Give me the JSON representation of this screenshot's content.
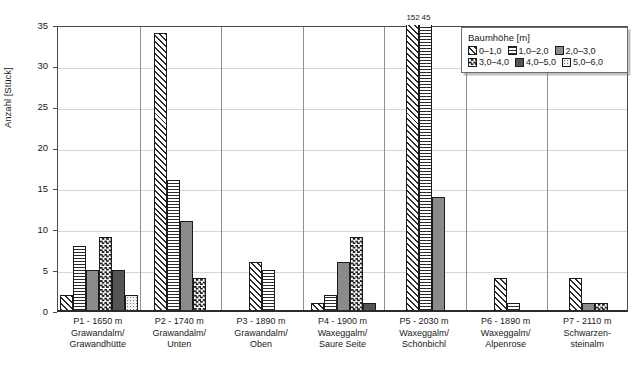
{
  "chart_data": {
    "type": "bar",
    "title": "",
    "xlabel": "",
    "ylabel": "Anzahl [Stück]",
    "ylim": [
      0,
      35
    ],
    "yticks": [
      0,
      5,
      10,
      15,
      20,
      25,
      30,
      35
    ],
    "grid": true,
    "legend": {
      "position": "top-right",
      "title": "Baumhöhe [m]",
      "entries": [
        "0–1,0",
        "1,0–2,0",
        "2,0–3,0",
        "3,0–4,0",
        "4,0–5,0",
        "5,0–6,0"
      ]
    },
    "categories": [
      "P1 - 1650 m\nGrawandalm/\nGrawandhütte",
      "P2 - 1740 m\nGrawandalm/\nUnten",
      "P3 - 1890 m\nGrawandalm/\nOben",
      "P4 - 1900 m\nWaxeggalm/\nSaure Seite",
      "P5 - 2030 m\nWaxeggalm/\nSchönbichl",
      "P6 - 1890 m\nWaxeggalm/\nAlpenrose",
      "P7 - 2110 m\nSchwarzen-\nsteinalm"
    ],
    "series": [
      {
        "name": "0–1,0",
        "values": [
          2,
          34,
          6,
          1,
          152,
          4,
          4
        ]
      },
      {
        "name": "1,0–2,0",
        "values": [
          8,
          16,
          5,
          2,
          45,
          1,
          0
        ]
      },
      {
        "name": "2,0–3,0",
        "values": [
          5,
          11,
          0,
          6,
          14,
          0,
          1
        ]
      },
      {
        "name": "3,0–4,0",
        "values": [
          9,
          4,
          0,
          9,
          0,
          0,
          1
        ]
      },
      {
        "name": "4,0–5,0",
        "values": [
          5,
          0,
          0,
          1,
          0,
          0,
          0
        ]
      },
      {
        "name": "5,0–6,0",
        "values": [
          2,
          0,
          0,
          0,
          0,
          0,
          0
        ]
      }
    ],
    "annotations": [
      {
        "group": "P5 - 2030 m",
        "series": "0–1,0",
        "text": "152"
      },
      {
        "group": "P5 - 2030 m",
        "series": "1,0–2,0",
        "text": "45"
      }
    ]
  },
  "axis": {
    "y_title": "Anzahl [Stück]",
    "y_ticks": [
      "0",
      "5",
      "10",
      "15",
      "20",
      "25",
      "30",
      "35"
    ]
  },
  "legend": {
    "title": "Baumhöhe [m]",
    "items": [
      {
        "label": "0–1,0"
      },
      {
        "label": "1,0–2,0"
      },
      {
        "label": "2,0–3,0"
      },
      {
        "label": "3,0–4,0"
      },
      {
        "label": "4,0–5,0"
      },
      {
        "label": "5,0–6,0"
      }
    ]
  },
  "groups": [
    {
      "line1": "P1 - 1650 m",
      "line2": "Grawandalm/",
      "line3": "Grawandhütte"
    },
    {
      "line1": "P2 - 1740 m",
      "line2": "Grawandalm/",
      "line3": "Unten"
    },
    {
      "line1": "P3 - 1890 m",
      "line2": "Grawandalm/",
      "line3": "Oben"
    },
    {
      "line1": "P4 - 1900 m",
      "line2": "Waxeggalm/",
      "line3": "Saure Seite"
    },
    {
      "line1": "P5 - 2030 m",
      "line2": "Waxeggalm/",
      "line3": "Schönbichl"
    },
    {
      "line1": "P6 - 1890 m",
      "line2": "Waxeggalm/",
      "line3": "Alpenrose"
    },
    {
      "line1": "P7 - 2110 m",
      "line2": "Schwarzen-",
      "line3": "steinalm"
    }
  ],
  "annotations": {
    "p5_bar1": "152",
    "p5_bar2": "45"
  }
}
